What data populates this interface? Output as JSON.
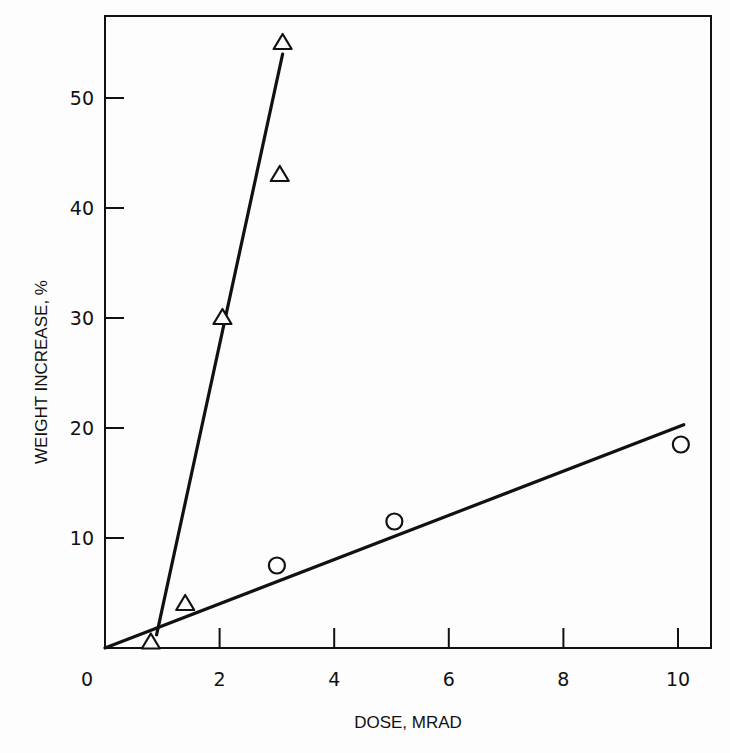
{
  "chart_data": {
    "type": "scatter",
    "title": "",
    "xlabel": "DOSE, MRAD",
    "ylabel": "WEIGHT INCREASE, %",
    "xlim": [
      0,
      10.6
    ],
    "ylim": [
      0,
      58
    ],
    "x_ticks": [
      0,
      2,
      4,
      6,
      8,
      10
    ],
    "x_tick_labels": [
      "0",
      "2",
      "4",
      "6",
      "8",
      "10"
    ],
    "y_ticks": [
      10,
      20,
      30,
      40,
      50
    ],
    "y_tick_labels": [
      "10",
      "20",
      "30",
      "40",
      "50"
    ],
    "grid": false,
    "legend": null,
    "series": [
      {
        "name": "triangles",
        "marker": "triangle-open",
        "points": [
          [
            0.8,
            0.5
          ],
          [
            1.4,
            4
          ],
          [
            2.05,
            30
          ],
          [
            3.05,
            43
          ],
          [
            3.1,
            55
          ]
        ],
        "fit_line": [
          [
            0.9,
            1.2
          ],
          [
            3.1,
            54
          ]
        ]
      },
      {
        "name": "circles",
        "marker": "circle-open",
        "points": [
          [
            3.0,
            7.5
          ],
          [
            5.05,
            11.5
          ],
          [
            10.05,
            18.5
          ]
        ],
        "fit_line": [
          [
            0,
            0
          ],
          [
            10.1,
            20.3
          ]
        ]
      }
    ]
  },
  "colors": {
    "ink": "#111111",
    "background": "#fdfdfd"
  }
}
